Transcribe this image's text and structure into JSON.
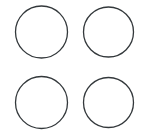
{
  "canvas": {
    "width": 150,
    "height": 130,
    "background_color": "#ffffff",
    "title": "Circle Grid"
  },
  "style": {
    "stroke_color": "#33383b",
    "stroke_width": 1.3,
    "fill": "none"
  },
  "figure": {
    "kind": "circle-outline-grid",
    "rows": 2,
    "columns": 2,
    "count": 4,
    "clipped_edge": "bottom"
  },
  "shapes": [
    {
      "name": "circle-top-left",
      "cx": 41.5,
      "cy": 32,
      "r": 26,
      "stroke": "#33383b",
      "stroke_width": 1.3,
      "clipped": false
    },
    {
      "name": "circle-top-right",
      "cx": 108.5,
      "cy": 32,
      "r": 25,
      "stroke": "#33383b",
      "stroke_width": 1.3,
      "clipped": false
    },
    {
      "name": "circle-bottom-left",
      "cx": 41.5,
      "cy": 102.5,
      "r": 26,
      "stroke": "#33383b",
      "stroke_width": 1.3,
      "clipped": true
    },
    {
      "name": "circle-bottom-right",
      "cx": 108.5,
      "cy": 102.5,
      "r": 25,
      "stroke": "#33383b",
      "stroke_width": 1.3,
      "clipped": true
    }
  ]
}
